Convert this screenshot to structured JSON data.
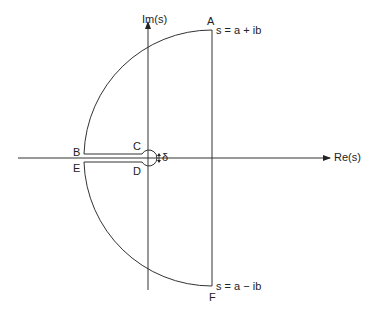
{
  "diagram": {
    "axes": {
      "x_label": "Re(s)",
      "y_label": "Im(s)"
    },
    "points": {
      "A": "A",
      "B": "B",
      "C": "C",
      "D": "D",
      "E": "E",
      "F": "F"
    },
    "annotations": {
      "top": "s = a + ib",
      "bottom": "s = a − ib",
      "delta": "δ"
    },
    "colors": {
      "stroke": "#333333",
      "background": "#ffffff"
    }
  }
}
